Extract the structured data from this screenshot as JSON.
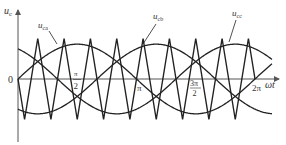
{
  "diagram": {
    "type": "spwm-waveform",
    "y_axis_label": "u",
    "y_axis_label_sub": "c",
    "x_axis_label": "ωt",
    "origin_label": "0",
    "x_ticks": [
      {
        "name": "pi-over-2",
        "num": "π",
        "den": "2",
        "value_rad": 1.5708
      },
      {
        "name": "pi",
        "text": "π",
        "value_rad": 3.1416
      },
      {
        "name": "three-pi-over-2",
        "num": "3π",
        "den": "2",
        "value_rad": 4.7124
      },
      {
        "name": "two-pi",
        "text": "2π",
        "value_rad": 6.2832
      }
    ],
    "carrier": {
      "name": "triangular-carrier",
      "periods_per_2pi": 9,
      "amplitude": 1.0,
      "start_phase": "zero-going-negative"
    },
    "references": [
      {
        "name": "u-ca",
        "label": "u",
        "sub": "ca",
        "phase_deg": 0,
        "amplitude": 0.86
      },
      {
        "name": "u-cb",
        "label": "u",
        "sub": "cb",
        "phase_deg": -120,
        "amplitude": 0.86
      },
      {
        "name": "u-cc",
        "label": "u",
        "sub": "cc",
        "phase_deg": 120,
        "amplitude": 0.86
      }
    ],
    "colors": {
      "line": "#222222",
      "axis": "#555555",
      "text": "#333333"
    }
  }
}
